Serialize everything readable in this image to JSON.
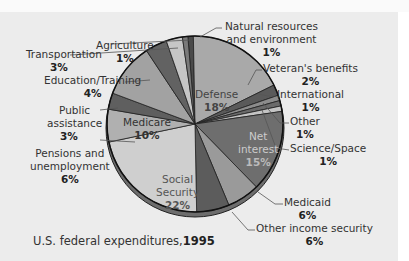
{
  "chart_data": {
    "type": "pie",
    "categories": [
      "Natural resources and environment",
      "Defense",
      "Veteran's benefits",
      "International",
      "Other",
      "Science/Space",
      "Net interest",
      "Medicaid",
      "Other income security",
      "Social Security",
      "Pensions and unemployment",
      "Public assistance",
      "Medicare",
      "Education/Training",
      "Transportation",
      "Agriculture"
    ],
    "values": [
      1,
      18,
      2,
      1,
      1,
      1,
      15,
      6,
      6,
      22,
      6,
      3,
      10,
      4,
      3,
      1
    ],
    "unit": "%",
    "colors": [
      "#4a4a4a",
      "#a9a9a9",
      "#5a5a5a",
      "#8c8c8c",
      "#6a6a6a",
      "#c4c4c4",
      "#6e6e6e",
      "#9a9a9a",
      "#5c5c5c",
      "#cfcfcf",
      "#b0b0b0",
      "#5f5f5f",
      "#a2a2a2",
      "#626262",
      "#c6c6c6",
      "#7a7a7a"
    ]
  },
  "labels": {
    "natural": {
      "name1": "Natural resources",
      "name2": "and environment",
      "pct": "1%"
    },
    "veterans": {
      "name": "Veteran's benefits",
      "pct": "2%"
    },
    "international": {
      "name": "International",
      "pct": "1%"
    },
    "other": {
      "name": "Other",
      "pct": "1%"
    },
    "science": {
      "name": "Science/Space",
      "pct": "1%"
    },
    "medicaid": {
      "name": "Medicaid",
      "pct": "6%"
    },
    "otherincome": {
      "name": "Other income security",
      "pct": "6%"
    },
    "pensions": {
      "name1": "Pensions and",
      "name2": "unemployment",
      "pct": "6%"
    },
    "public": {
      "name1": "Public",
      "name2": "assistance",
      "pct": "3%"
    },
    "education": {
      "name": "Education/Training",
      "pct": "4%"
    },
    "transportation": {
      "name": "Transportation",
      "pct": "3%"
    },
    "agriculture": {
      "name": "Agriculture",
      "pct": "1%"
    },
    "defense": {
      "name": "Defense",
      "pct": "18%"
    },
    "medicare": {
      "name": "Medicare",
      "pct": "10%"
    },
    "netinterest": {
      "name1": "Net",
      "name2": "interest",
      "pct": "15%"
    },
    "socialsecurity": {
      "name1": "Social",
      "name2": "Security",
      "pct": "22%"
    }
  },
  "caption": {
    "text": "U.S. federal expenditures,",
    "year": "1995"
  }
}
